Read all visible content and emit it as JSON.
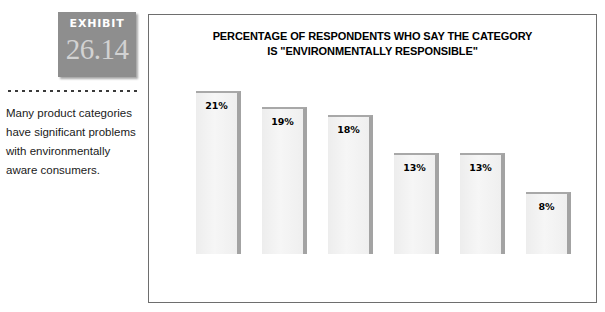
{
  "exhibit": {
    "label": "EXHIBIT",
    "number": "26.14"
  },
  "caption": {
    "text": "Many product categories have significant problems with environmentally aware consumers."
  },
  "chart_data": {
    "type": "bar",
    "title": "PERCENTAGE OF RESPONDENTS WHO SAY THE CATEGORY IS \"ENVIRONMENTALLY RESPONSIBLE\"",
    "title_line1": "PERCENTAGE OF RESPONDENTS WHO SAY THE CATEGORY",
    "title_line2": "IS \"ENVIRONMENTALLY RESPONSIBLE\"",
    "categories": [
      "Beverages",
      "Laundry Detergent",
      "Fast-Food Restaurants",
      "Disposable Diapers",
      "Automotive Products",
      "Cosmetics"
    ],
    "category_lines": [
      [
        "Beverages"
      ],
      [
        "Laundry",
        "Detergent"
      ],
      [
        "Fast-Food",
        "Restaurants"
      ],
      [
        "Disposable",
        "Diapers"
      ],
      [
        "Automotive",
        "Products"
      ],
      [
        "Cosmetics"
      ]
    ],
    "values": [
      21,
      19,
      18,
      13,
      13,
      8
    ],
    "value_labels": [
      "21%",
      "19%",
      "18%",
      "13%",
      "13%",
      "8%"
    ],
    "xlabel": "",
    "ylabel": "",
    "ylim": [
      0,
      22
    ],
    "grid": false,
    "legend": false,
    "bar_fill_color": "#f2f2f2",
    "bar_edge_color": "#a3a3a3",
    "axis_color": "#222222"
  },
  "colors": {
    "badge_background": "#8e8e8e",
    "badge_number": "#d2d2d2",
    "frame_border": "#6e6e6e",
    "text": "#000000"
  }
}
